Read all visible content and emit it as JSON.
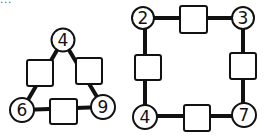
{
  "caption": "...",
  "puzzles": [
    {
      "name": "triangle",
      "corners": [
        "4",
        "6",
        "9"
      ],
      "empty_boxes": 3
    },
    {
      "name": "square",
      "corners": [
        "2",
        "3",
        "4",
        "7"
      ],
      "empty_boxes": 4
    }
  ]
}
